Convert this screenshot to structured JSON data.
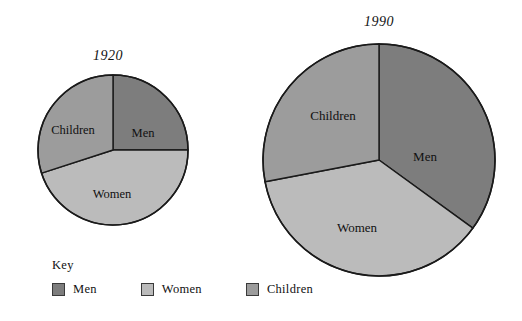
{
  "figure": {
    "background": "#ffffff",
    "stroke": "#1a1a1a"
  },
  "chart_data": [
    {
      "type": "pie",
      "title": "1920",
      "categories": [
        "Men",
        "Women",
        "Children"
      ],
      "values": [
        25,
        45,
        30
      ],
      "unit": "percent",
      "colors": [
        "#7d7d7d",
        "#bbbbbb",
        "#9c9c9c"
      ],
      "start_angle_deg": 0,
      "direction": "clockwise",
      "labels_inside": true,
      "legend": "bottom",
      "grid": false,
      "center": {
        "x": 113,
        "y": 150
      },
      "radius": 75,
      "slice_labels": [
        {
          "name": "Men",
          "text": "Men",
          "x": 143,
          "y": 134
        },
        {
          "name": "Women",
          "text": "Women",
          "x": 112,
          "y": 195
        },
        {
          "name": "Children",
          "text": "Children",
          "x": 73,
          "y": 131
        }
      ]
    },
    {
      "type": "pie",
      "title": "1990",
      "categories": [
        "Men",
        "Women",
        "Children"
      ],
      "values": [
        35,
        37,
        28
      ],
      "unit": "percent",
      "colors": [
        "#7d7d7d",
        "#bbbbbb",
        "#9c9c9c"
      ],
      "start_angle_deg": 0,
      "direction": "clockwise",
      "labels_inside": true,
      "legend": "bottom",
      "grid": false,
      "center": {
        "x": 379,
        "y": 160
      },
      "radius": 116,
      "slice_labels": [
        {
          "name": "Men",
          "text": "Men",
          "x": 425,
          "y": 158
        },
        {
          "name": "Women",
          "text": "Women",
          "x": 357,
          "y": 229
        },
        {
          "name": "Children",
          "text": "Children",
          "x": 333,
          "y": 117
        }
      ]
    }
  ],
  "key": {
    "title": "Key",
    "items": [
      {
        "label": "Men",
        "color": "#7d7d7d",
        "swatch_name": "key-swatch-men"
      },
      {
        "label": "Women",
        "color": "#bbbbbb",
        "swatch_name": "key-swatch-women"
      },
      {
        "label": "Children",
        "color": "#9c9c9c",
        "swatch_name": "key-swatch-children"
      }
    ]
  }
}
